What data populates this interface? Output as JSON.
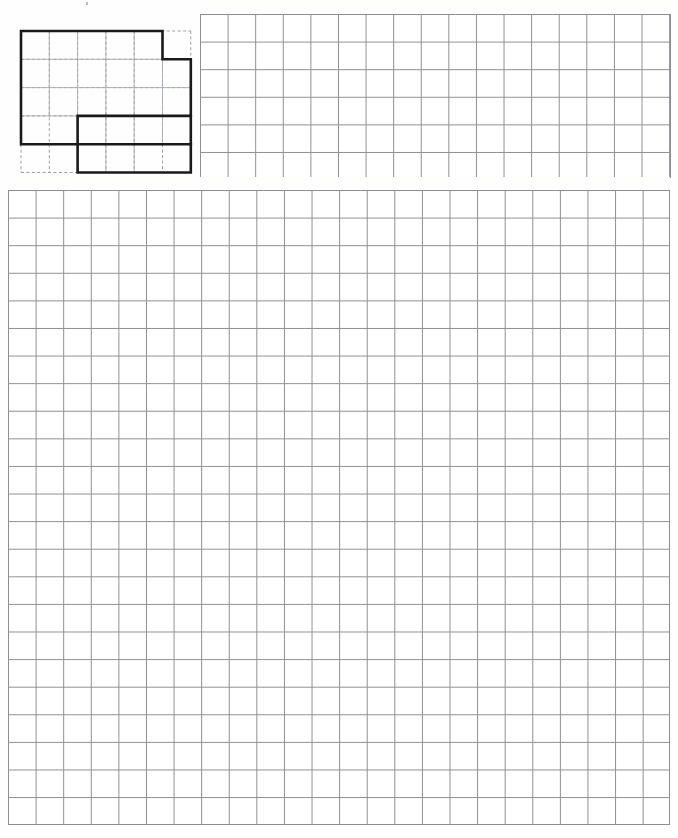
{
  "document": {
    "type": "grid-paper-worksheet",
    "background_color": "#fefefe",
    "grid_line_color": "#8d8f94",
    "shape_outline_color": "#1a1a1a",
    "shape_grid_color": "#9aa0a8"
  },
  "shape_figure": {
    "name": "rectilinear-polygon",
    "grid_columns": 6,
    "grid_rows": 5,
    "cell_px": 28.3,
    "origin": {
      "x": 21,
      "y": 31
    },
    "outline_width_px": 2.6,
    "dashed_guides": true,
    "vertices_in_cells": [
      [
        0,
        0
      ],
      [
        5,
        0
      ],
      [
        5,
        1
      ],
      [
        6,
        1
      ],
      [
        6,
        4
      ],
      [
        2,
        4
      ],
      [
        2,
        5
      ],
      [
        6,
        5
      ],
      [
        6,
        4
      ],
      [
        0,
        4
      ],
      [
        0,
        0
      ]
    ],
    "path_cells": [
      [
        0,
        0
      ],
      [
        5,
        0
      ],
      [
        5,
        1
      ],
      [
        6,
        1
      ],
      [
        6,
        3
      ],
      [
        2,
        3
      ],
      [
        2,
        5
      ],
      [
        6,
        5
      ],
      [
        6,
        4
      ],
      [
        0,
        4
      ],
      [
        0,
        0
      ]
    ]
  },
  "grids": [
    {
      "name": "upper-right-grid",
      "x": 200,
      "y": 14,
      "width": 470,
      "height": 163,
      "columns": 17,
      "rows": 6,
      "cell_px": 27.6,
      "line_color": "#8d8f94"
    },
    {
      "name": "main-answer-grid",
      "x": 8,
      "y": 190,
      "width": 662,
      "height": 635,
      "columns": 24,
      "rows": 23,
      "cell_px": 27.6,
      "line_color": "#8d8f94"
    }
  ],
  "marks": [
    {
      "name": "scan-speck-top",
      "x": 86,
      "y": 2
    }
  ],
  "labels": {
    "none_visible": ""
  }
}
